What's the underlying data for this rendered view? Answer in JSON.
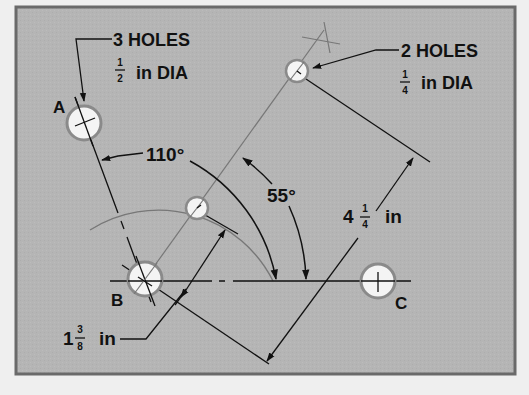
{
  "colors": {
    "background": "#efefef",
    "plate": "#b5b5b5",
    "plate_border": "#6a6a6a",
    "ink": "#111111",
    "construction": "#6f6f6f",
    "hole_fill": "#f4f4f4",
    "hole_ring": "#8a8a8a"
  },
  "callouts": {
    "large_holes": {
      "count_text": "3 HOLES",
      "frac_num": "1",
      "frac_den": "2",
      "size_text": "in DIA"
    },
    "small_holes": {
      "count_text": "2 HOLES",
      "frac_num": "1",
      "frac_den": "4",
      "size_text": "in DIA"
    }
  },
  "points": {
    "a": "A",
    "b": "B",
    "c": "C"
  },
  "angles": {
    "large": "110°",
    "small": "55°"
  },
  "dimensions": {
    "long": {
      "whole": "4",
      "frac_num": "1",
      "frac_den": "4",
      "unit": "in"
    },
    "short": {
      "whole": "1",
      "frac_num": "3",
      "frac_den": "8",
      "unit": "in"
    }
  }
}
